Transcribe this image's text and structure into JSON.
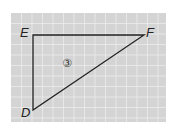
{
  "figure": {
    "background": "#d4d4d4",
    "grid_color": "#ececec",
    "line_color": "#222222",
    "grid": {
      "x0": 11,
      "y0": 13,
      "x1": 166,
      "y1": 122,
      "step": 10.5
    }
  },
  "triangle": {
    "name": "DEF",
    "vertices": [
      {
        "label": "E",
        "x": 33,
        "y": 35
      },
      {
        "label": "F",
        "x": 144,
        "y": 35
      },
      {
        "label": "D",
        "x": 33,
        "y": 110
      }
    ],
    "right_angle_at": "E"
  },
  "labels": {
    "E": "E",
    "F": "F",
    "D": "D",
    "region": "③"
  }
}
